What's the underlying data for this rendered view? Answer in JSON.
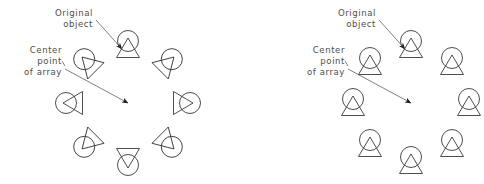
{
  "figure": {
    "background_color": "#ffffff",
    "stroke_color": "#3a3a3a",
    "leader_color": "#4a4a4a",
    "text_color": "#4e4e4e"
  },
  "labels": {
    "original_object_line1": "Original",
    "original_object_line2": "object",
    "center_point_line1": "Center",
    "center_point_line2": "point",
    "center_point_line3": "of  array"
  },
  "panels": [
    {
      "id": "rotated",
      "name": "polar-array-rotated",
      "center": {
        "x": 128,
        "y": 103
      },
      "radius": 58,
      "count": 8,
      "rotate_items": true,
      "original_index": 0,
      "items": [
        {
          "index": 0,
          "angle_deg": 0,
          "x": 128,
          "y": 45,
          "rotation_deg": 0,
          "is_original": true
        },
        {
          "index": 1,
          "angle_deg": 45,
          "x": 169,
          "y": 62,
          "rotation_deg": 45,
          "is_original": false
        },
        {
          "index": 2,
          "angle_deg": 90,
          "x": 186,
          "y": 103,
          "rotation_deg": 90,
          "is_original": false
        },
        {
          "index": 3,
          "angle_deg": 135,
          "x": 169,
          "y": 144,
          "rotation_deg": 135,
          "is_original": false
        },
        {
          "index": 4,
          "angle_deg": 180,
          "x": 128,
          "y": 161,
          "rotation_deg": 180,
          "is_original": false
        },
        {
          "index": 5,
          "angle_deg": 225,
          "x": 87,
          "y": 144,
          "rotation_deg": 225,
          "is_original": false
        },
        {
          "index": 6,
          "angle_deg": 270,
          "x": 70,
          "y": 103,
          "rotation_deg": 270,
          "is_original": false
        },
        {
          "index": 7,
          "angle_deg": 315,
          "x": 87,
          "y": 62,
          "rotation_deg": 315,
          "is_original": false
        }
      ],
      "original_leader": {
        "x1": 96,
        "y1": 20,
        "x2": 122,
        "y2": 49
      },
      "center_leader": {
        "x1": 65,
        "y1": 69,
        "x2": 128,
        "y2": 103
      },
      "original_text_pos": {
        "x": 93,
        "y": 16
      },
      "center_text_pos": {
        "x": 62,
        "y": 53
      }
    },
    {
      "id": "non-rotated",
      "name": "polar-array-not-rotated",
      "center": {
        "x": 411,
        "y": 103
      },
      "radius": 58,
      "count": 8,
      "rotate_items": false,
      "original_index": 0,
      "items": [
        {
          "index": 0,
          "angle_deg": 0,
          "x": 411,
          "y": 45,
          "rotation_deg": 0,
          "is_original": true
        },
        {
          "index": 1,
          "angle_deg": 45,
          "x": 452,
          "y": 62,
          "rotation_deg": 0,
          "is_original": false
        },
        {
          "index": 2,
          "angle_deg": 90,
          "x": 469,
          "y": 103,
          "rotation_deg": 0,
          "is_original": false
        },
        {
          "index": 3,
          "angle_deg": 135,
          "x": 452,
          "y": 144,
          "rotation_deg": 0,
          "is_original": false
        },
        {
          "index": 4,
          "angle_deg": 180,
          "x": 411,
          "y": 161,
          "rotation_deg": 0,
          "is_original": false
        },
        {
          "index": 5,
          "angle_deg": 225,
          "x": 370,
          "y": 144,
          "rotation_deg": 0,
          "is_original": false
        },
        {
          "index": 6,
          "angle_deg": 270,
          "x": 353,
          "y": 103,
          "rotation_deg": 0,
          "is_original": false
        },
        {
          "index": 7,
          "angle_deg": 315,
          "x": 370,
          "y": 62,
          "rotation_deg": 0,
          "is_original": false
        }
      ],
      "original_leader": {
        "x1": 379,
        "y1": 20,
        "x2": 405,
        "y2": 49
      },
      "center_leader": {
        "x1": 348,
        "y1": 69,
        "x2": 411,
        "y2": 103
      },
      "original_text_pos": {
        "x": 376,
        "y": 16
      },
      "center_text_pos": {
        "x": 345,
        "y": 53
      }
    }
  ],
  "symbol": {
    "name": "circle-triangle-marker",
    "description": "circle with overlapping triangle, apex inside circle",
    "circle_radius": 10.5,
    "circle_offset_y": -4.0,
    "triangle_apex_y": -7.0,
    "triangle_base_y": 12.5,
    "triangle_half_width": 11.5
  }
}
